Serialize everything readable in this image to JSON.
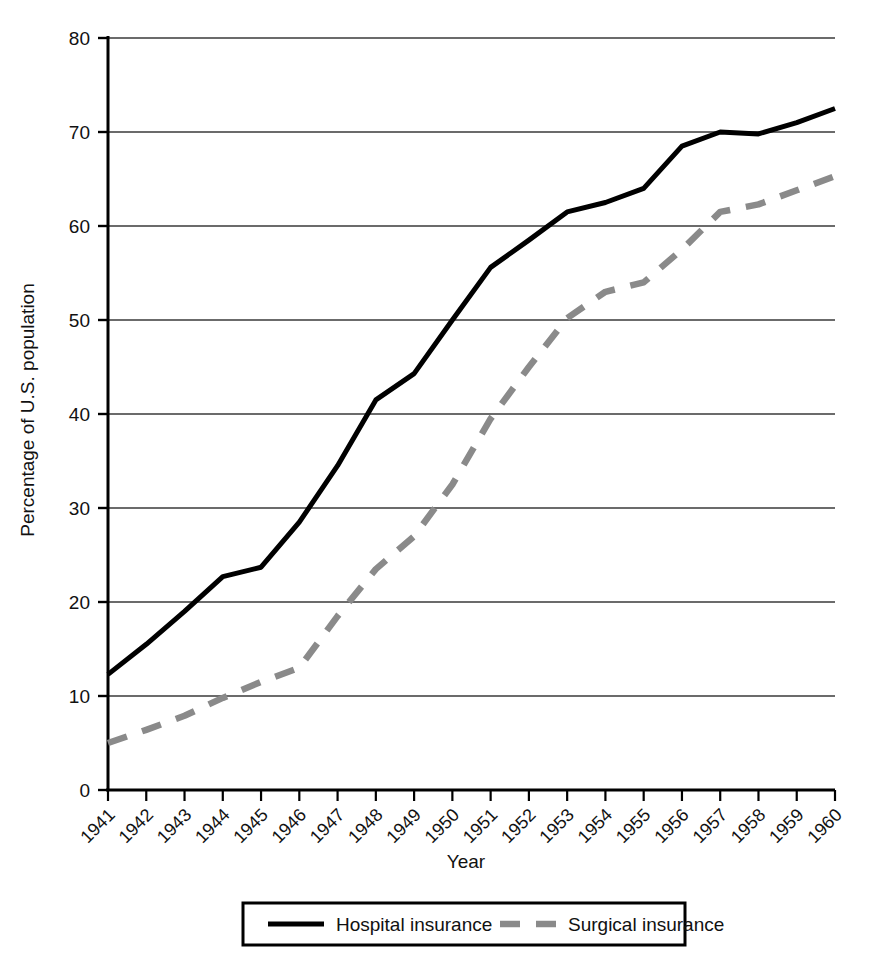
{
  "chart_data": {
    "type": "line",
    "title": "",
    "xlabel": "Year",
    "ylabel": "Percentage of U.S. population",
    "x": [
      1941,
      1942,
      1943,
      1944,
      1945,
      1946,
      1947,
      1948,
      1949,
      1950,
      1951,
      1952,
      1953,
      1954,
      1955,
      1956,
      1957,
      1958,
      1959,
      1960
    ],
    "xtick_labels": [
      "1941",
      "1942",
      "1943",
      "1944",
      "1945",
      "1946",
      "1947",
      "1948",
      "1949",
      "1950",
      "1951",
      "1952",
      "1953",
      "1954",
      "1955",
      "1956",
      "1957",
      "1958",
      "1959",
      "1960"
    ],
    "ytick_labels": [
      "0",
      "10",
      "20",
      "30",
      "40",
      "50",
      "60",
      "70",
      "80"
    ],
    "yticks": [
      0,
      10,
      20,
      30,
      40,
      50,
      60,
      70,
      80
    ],
    "ylim": [
      0,
      80
    ],
    "xlim": [
      1941,
      1960
    ],
    "grid": "horizontal",
    "legend_position": "bottom-center",
    "series": [
      {
        "name": "Hospital insurance",
        "style": "solid",
        "color": "#000000",
        "values": [
          12.3,
          15.5,
          19.0,
          22.7,
          23.7,
          28.5,
          34.5,
          41.5,
          44.3,
          50.0,
          55.6,
          58.5,
          61.5,
          62.5,
          64.0,
          68.5,
          70.0,
          69.8,
          71.0,
          72.5
        ]
      },
      {
        "name": "Surgical insurance",
        "style": "dashed",
        "color": "#8a8a8a",
        "values": [
          5.0,
          6.4,
          7.9,
          9.8,
          11.5,
          13.0,
          18.5,
          23.5,
          27.0,
          32.5,
          39.5,
          45.0,
          50.2,
          53.0,
          54.0,
          57.5,
          61.5,
          62.3,
          63.8,
          65.3
        ]
      }
    ],
    "legend": [
      {
        "label": "Hospital insurance",
        "style": "solid",
        "color": "#000000"
      },
      {
        "label": "Surgical insurance",
        "style": "dashed",
        "color": "#8a8a8a"
      }
    ],
    "axis_color": "#000000",
    "grid_color": "#3a3a3a"
  }
}
